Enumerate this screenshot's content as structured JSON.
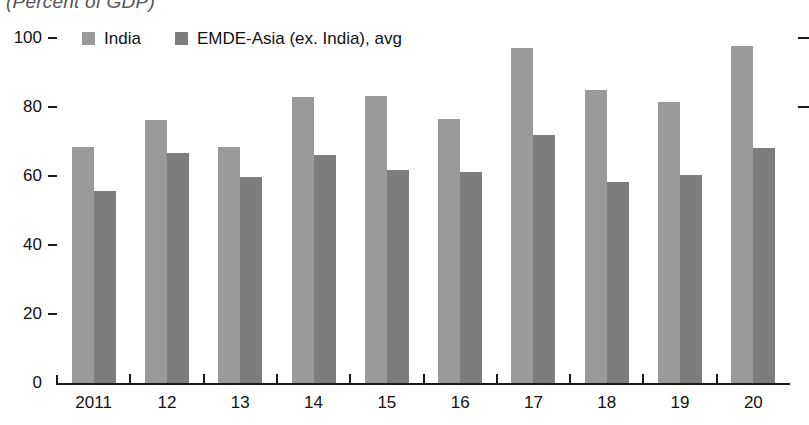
{
  "subtitle": "(Percent of GDP)",
  "legend": {
    "position": "top-left",
    "entries": [
      {
        "label": "India",
        "color": "#9a9a9a",
        "name": "legend-india"
      },
      {
        "label": "EMDE-Asia (ex. India), avg",
        "color": "#7d7d7d",
        "name": "legend-emde-asia"
      }
    ]
  },
  "axis": {
    "y_ticks": [
      "0",
      "20",
      "40",
      "60",
      "80",
      "100"
    ],
    "y_tick_values": [
      0,
      20,
      40,
      60,
      80,
      100
    ],
    "x_ticks": [
      "2011",
      "12",
      "13",
      "14",
      "15",
      "16",
      "17",
      "18",
      "19",
      "20"
    ]
  },
  "colors": {
    "india": "#9a9a9a",
    "emde": "#7d7d7d",
    "axis": "#1a1a1a",
    "background": "#ffffff"
  },
  "chart_data": {
    "type": "bar",
    "title": "",
    "subtitle": "(Percent of GDP)",
    "xlabel": "",
    "ylabel": "",
    "ylim": [
      0,
      100
    ],
    "grid": false,
    "legend_position": "top-left",
    "categories": [
      "2011",
      "12",
      "13",
      "14",
      "15",
      "16",
      "17",
      "18",
      "19",
      "20"
    ],
    "series": [
      {
        "name": "India",
        "color": "#9a9a9a",
        "values": [
          68.5,
          76.3,
          68.3,
          83.0,
          83.2,
          76.5,
          97.0,
          84.8,
          81.4,
          97.8
        ]
      },
      {
        "name": "EMDE-Asia (ex. India), avg",
        "color": "#7d7d7d",
        "values": [
          55.7,
          66.8,
          59.6,
          66.0,
          61.8,
          61.2,
          71.8,
          58.2,
          60.2,
          68.2
        ]
      }
    ]
  }
}
